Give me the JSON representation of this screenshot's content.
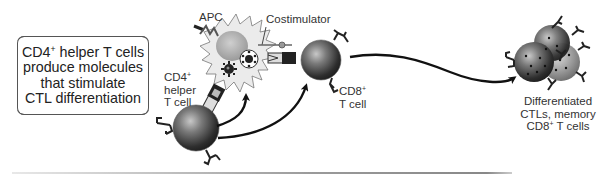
{
  "caption": {
    "lines": [
      "CD4+ helper T cells",
      "produce molecules",
      "that stimulate",
      "CTL differentiation"
    ],
    "line1_prefix": "CD4",
    "line1_sup": "+",
    "line1_suffix": " helper T cells",
    "line2": "produce molecules",
    "line3": "that stimulate",
    "line4": "CTL differentiation"
  },
  "labels": {
    "apc": "APC",
    "costimulator": "Costimulator",
    "cd4_helper": {
      "line1_prefix": "CD4",
      "line1_sup": "+",
      "line2": "helper",
      "line3": "T cell"
    },
    "cd8_tcell": {
      "line1_prefix": "CD8",
      "line1_sup": "+",
      "line2": "T cell"
    },
    "differentiated": {
      "line1": "Differentiated",
      "line2": "CTLs, memory",
      "line3_prefix": "CD8",
      "line3_sup": "+",
      "line3_suffix": " T cells"
    }
  },
  "colors": {
    "cell_dark": "#3a3a3a",
    "cell_mid": "#8a8a8a",
    "apc_fill": "#e9e9e9",
    "arrow": "#111111",
    "text": "#222222"
  },
  "elements": {
    "apc_cell": "antigen-presenting-cell",
    "cd4_cell": "cd4-helper-t-cell",
    "cd8_cell": "cd8-t-cell",
    "ctl_cluster": "differentiated-ctl-cluster"
  }
}
